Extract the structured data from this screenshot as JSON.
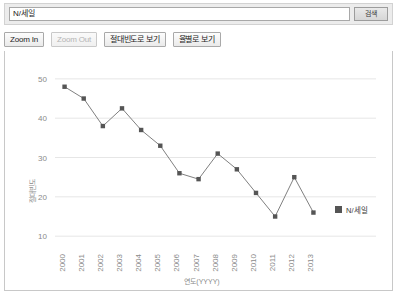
{
  "search": {
    "query": "N/세일",
    "placeholder": "",
    "button_label": "검색"
  },
  "toolbar": {
    "zoom_in_label": "Zoom In",
    "zoom_out_label": "Zoom Out",
    "absolute_freq_label": "절대빈도로 보기",
    "rate_label": "율별로 보기"
  },
  "legend": {
    "series_label": "N/세일",
    "marker_color": "#555555"
  },
  "chart_data": {
    "type": "line",
    "title": "",
    "xlabel": "연도(YYYY)",
    "ylabel": "절대빈도",
    "categories": [
      "2000",
      "2001",
      "2002",
      "2003",
      "2004",
      "2005",
      "2006",
      "2007",
      "2008",
      "2009",
      "2010",
      "2011",
      "2012",
      "2013"
    ],
    "series": [
      {
        "name": "N/세일",
        "color": "#555555",
        "values": [
          48,
          45,
          38,
          42.5,
          37,
          33,
          26,
          24.5,
          31,
          27,
          21,
          15,
          25,
          16
        ]
      }
    ],
    "yticks": [
      10,
      20,
      30,
      40,
      50
    ],
    "ylim": [
      7.5,
      52
    ],
    "grid": true,
    "legend_position": "right"
  }
}
